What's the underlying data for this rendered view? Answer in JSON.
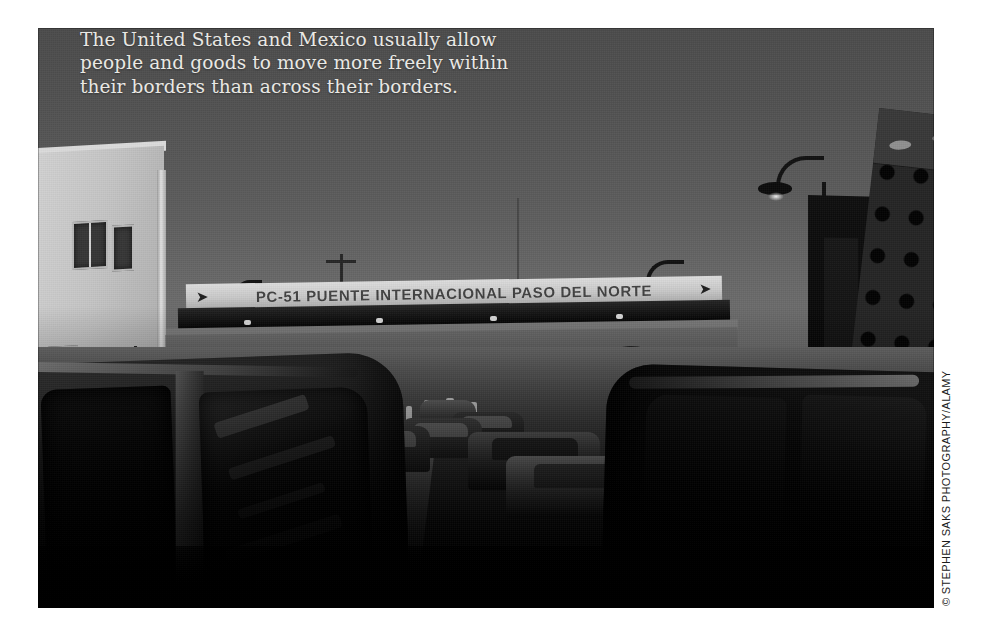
{
  "page": {
    "background_color": "#ffffff",
    "photo": {
      "x": 38,
      "y": 28,
      "width": 896,
      "height": 580,
      "rendering": "black-and-white photograph",
      "subject": "Vehicle queue at the Paso del Norte international bridge border crossing between the United States and Mexico"
    }
  },
  "caption": {
    "line1": "The United States and Mexico usually allow",
    "line2": "people and goods to move more freely within",
    "line3": "their borders than across their borders.",
    "color": "#e9e8e4"
  },
  "photo_credit": {
    "text": "© STEPHEN SAKS PHOTOGRAPHY/ALAMY",
    "orientation": "vertical-bottom-to-top",
    "color": "#1b1b1b"
  },
  "signage": {
    "bridge_sign": "PC-51  PUENTE INTERNACIONAL PASO DEL NORTE",
    "bridge_sign_ornament_left": "bird-silhouette-icon",
    "bridge_sign_ornament_right": "bird-silhouette-icon",
    "distant_sign": "FELIZ V"
  },
  "left_margin_marks": [
    "·",
    "┐",
    "·",
    "◦",
    "•",
    "·",
    "●",
    "·",
    "│",
    "·"
  ],
  "scene_elements": {
    "sky": "overcast daylight sky, mid-grey gradient",
    "left_building": "light stucco building with windows and downpipe",
    "right_structure": "dark perforated panel tower with circular openings",
    "street_lamps": 4,
    "arches": 4,
    "foreground_vehicles": [
      "dark van at left",
      "dark car at right"
    ],
    "queued_vehicles": 6,
    "pedestrians": 7
  }
}
